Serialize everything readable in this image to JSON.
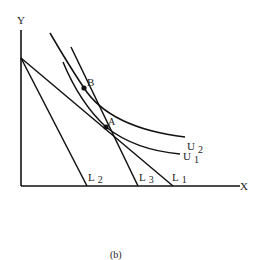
{
  "diagram": {
    "caption": "(b)",
    "axes": {
      "x_label": "X",
      "y_label": "Y"
    },
    "points": [
      {
        "label": "A"
      },
      {
        "label": "B"
      }
    ],
    "budget_lines": [
      {
        "label": "L",
        "sub": "1"
      },
      {
        "label": "L",
        "sub": "2"
      },
      {
        "label": "L",
        "sub": "3"
      }
    ],
    "indifference_curves": [
      {
        "label": "U",
        "sub": "1"
      },
      {
        "label": "U",
        "sub": "2"
      }
    ],
    "colors": {
      "ink": "#111111",
      "background": "#ffffff"
    }
  }
}
